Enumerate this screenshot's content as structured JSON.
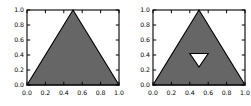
{
  "figure": {
    "background_color": "#ffffff",
    "width": 251,
    "height": 106,
    "panel_count": 2
  },
  "style": {
    "fill_color": "#666666",
    "hole_color": "#ffffff",
    "edge_color": "#000000",
    "frame_color": "#000000",
    "tick_color": "#000000"
  },
  "chart_data": [
    {
      "type": "area",
      "title": "",
      "subtitle": "",
      "xlabel": "",
      "ylabel": "",
      "xlim": [
        0.0,
        1.0
      ],
      "ylim": [
        0.0,
        1.0
      ],
      "grid": false,
      "legend": null,
      "panel_index": 0,
      "panel_name": "sierpinski-iteration-0",
      "xticks": [
        0.0,
        0.2,
        0.4,
        0.6,
        0.8,
        1.0
      ],
      "xtick_labels": [
        "0.0",
        "0.2",
        "0.4",
        "0.6",
        "0.8",
        "1.0"
      ],
      "yticks": [
        0.0,
        0.2,
        0.4,
        0.6,
        0.8,
        1.0
      ],
      "ytick_labels": [
        "0.0",
        "0.2",
        "0.4",
        "0.6",
        "0.8",
        "1.0"
      ],
      "polygons": [
        {
          "name": "outer-triangle",
          "fill": "#666666",
          "edge": "#000000",
          "points": [
            [
              0.0,
              0.0
            ],
            [
              1.0,
              0.0
            ],
            [
              0.5,
              1.0
            ]
          ]
        }
      ]
    },
    {
      "type": "area",
      "title": "",
      "subtitle": "",
      "xlabel": "",
      "ylabel": "",
      "xlim": [
        0.0,
        1.0
      ],
      "ylim": [
        0.0,
        1.0
      ],
      "grid": false,
      "legend": null,
      "panel_index": 1,
      "panel_name": "sierpinski-iteration-1",
      "xticks": [
        0.0,
        0.2,
        0.4,
        0.6,
        0.8,
        1.0
      ],
      "xtick_labels": [
        "0.0",
        "0.2",
        "0.4",
        "0.6",
        "0.8",
        "1.0"
      ],
      "yticks": [
        0.0,
        0.2,
        0.4,
        0.6,
        0.8,
        1.0
      ],
      "ytick_labels": [
        "0.0",
        "0.2",
        "0.4",
        "0.6",
        "0.8",
        "1.0"
      ],
      "polygons": [
        {
          "name": "outer-triangle",
          "fill": "#666666",
          "edge": "#000000",
          "points": [
            [
              0.0,
              0.0
            ],
            [
              1.0,
              0.0
            ],
            [
              0.5,
              1.0
            ]
          ]
        },
        {
          "name": "inverted-hole-triangle",
          "fill": "#ffffff",
          "edge": "#000000",
          "points": [
            [
              0.4,
              0.42
            ],
            [
              0.6,
              0.42
            ],
            [
              0.5,
              0.24
            ]
          ]
        }
      ]
    }
  ],
  "axes_labels": {
    "y": [
      "1.0",
      "0.8",
      "0.6",
      "0.4",
      "0.2",
      "0.0"
    ],
    "x": [
      "0.0",
      "0.2",
      "0.4",
      "0.6",
      "0.8",
      "1.0"
    ]
  }
}
